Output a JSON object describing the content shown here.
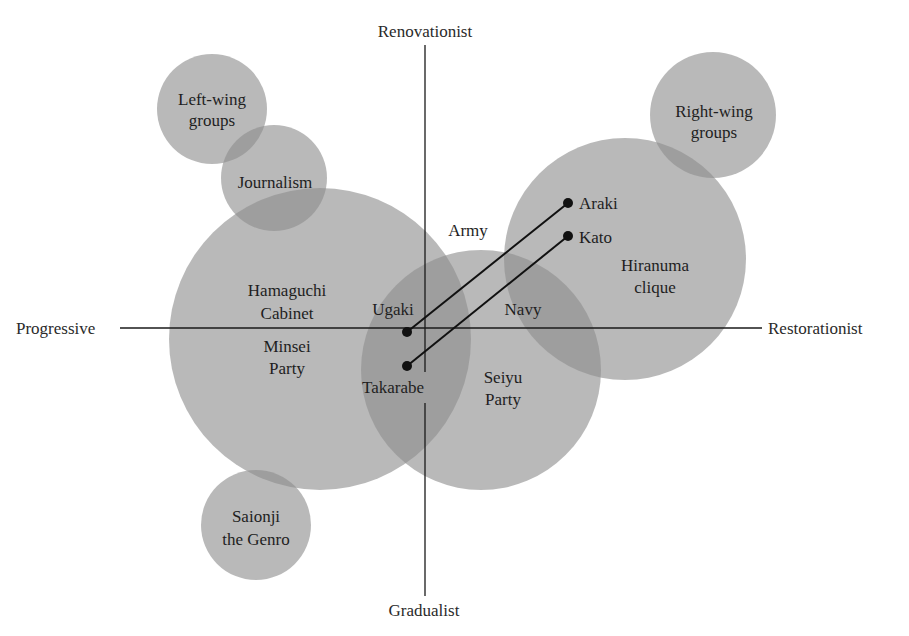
{
  "axes": {
    "top": "Renovationist",
    "bottom": "Gradualist",
    "left": "Progressive",
    "right": "Restorationist"
  },
  "groups": {
    "left_wing": [
      "Left-wing",
      "groups"
    ],
    "journalism": "Journalism",
    "hamaguchi": [
      "Hamaguchi",
      "Cabinet"
    ],
    "minsei": [
      "Minsei",
      "Party"
    ],
    "army": "Army",
    "navy": "Navy",
    "seiyu": [
      "Seiyu",
      "Party"
    ],
    "hiranuma": [
      "Hiranuma",
      "clique"
    ],
    "right_wing": [
      "Right-wing",
      "groups"
    ],
    "saionji": [
      "Saionji",
      "the Genro"
    ]
  },
  "people": {
    "araki": "Araki",
    "kato": "Kato",
    "ugaki": "Ugaki",
    "takarabe": "Takarabe"
  },
  "colors": {
    "circle_fill": "#8c8c8c",
    "circle_opacity": "0.62",
    "line": "#111111",
    "text": "#1e1e1e"
  }
}
